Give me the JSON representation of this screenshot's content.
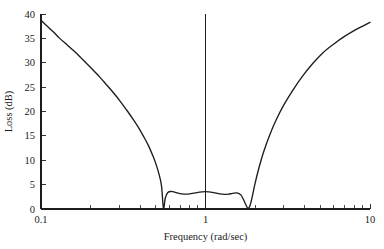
{
  "chart_data": {
    "type": "line",
    "title": "",
    "xlabel": "Frequency (rad/sec)",
    "ylabel": "Loss (dB)",
    "xscale": "log",
    "yscale": "linear",
    "xlim": [
      0.1,
      10
    ],
    "ylim": [
      0,
      40
    ],
    "xticks": [
      0.1,
      1,
      10
    ],
    "xtick_labels": [
      "0.1",
      "1",
      "10"
    ],
    "xminor_ticks": [
      0.2,
      0.3,
      0.4,
      0.5,
      0.6,
      0.7,
      0.8,
      0.9,
      2,
      3,
      4,
      5,
      6,
      7,
      8,
      9
    ],
    "yticks": [
      0,
      5,
      10,
      15,
      20,
      25,
      30,
      35,
      40
    ],
    "ytick_labels": [
      "0",
      "5",
      "10",
      "15",
      "20",
      "25",
      "30",
      "35",
      "40"
    ],
    "grid": false,
    "legend": null,
    "annotations": [
      {
        "name": "center-frequency-marker",
        "type": "vline",
        "x": 1,
        "y_from": 0,
        "y_to": 40
      }
    ],
    "line_color": "#1d1d1d",
    "series": [
      {
        "name": "Loss",
        "description": "Equiripple bandstop filter loss response with two zeros of transmission near 0.55 and 1.8 rad/sec and a passband ripple peak of about 3.5 dB at 1 rad/sec",
        "x": [
          0.1,
          0.11,
          0.12,
          0.13,
          0.145,
          0.16,
          0.175,
          0.19,
          0.21,
          0.23,
          0.25,
          0.27,
          0.3,
          0.33,
          0.36,
          0.39,
          0.42,
          0.45,
          0.48,
          0.5,
          0.52,
          0.54,
          0.555,
          0.57,
          0.59,
          0.62,
          0.65,
          0.68,
          0.72,
          0.76,
          0.8,
          0.85,
          0.9,
          0.95,
          1.0,
          1.05,
          1.1,
          1.16,
          1.22,
          1.3,
          1.38,
          1.46,
          1.55,
          1.64,
          1.72,
          1.78,
          1.82,
          1.86,
          1.92,
          2.0,
          2.1,
          2.25,
          2.45,
          2.7,
          3.0,
          3.4,
          3.9,
          4.5,
          5.2,
          6.0,
          7.0,
          8.2,
          10.0
        ],
        "y": [
          38.7,
          37.4,
          36.2,
          35.0,
          33.6,
          32.3,
          31.0,
          29.8,
          28.3,
          26.9,
          25.5,
          24.2,
          22.3,
          20.4,
          18.6,
          16.8,
          14.9,
          13.0,
          10.8,
          9.2,
          7.3,
          4.8,
          0.15,
          2.3,
          3.4,
          3.6,
          3.45,
          3.25,
          3.1,
          3.05,
          3.1,
          3.25,
          3.4,
          3.5,
          3.55,
          3.5,
          3.4,
          3.25,
          3.1,
          3.0,
          3.05,
          3.2,
          3.3,
          2.9,
          1.6,
          0.5,
          0.15,
          0.6,
          2.4,
          5.2,
          8.1,
          11.6,
          15.1,
          18.4,
          21.4,
          24.4,
          27.3,
          29.9,
          32.1,
          33.8,
          35.4,
          36.8,
          38.3
        ]
      }
    ]
  }
}
